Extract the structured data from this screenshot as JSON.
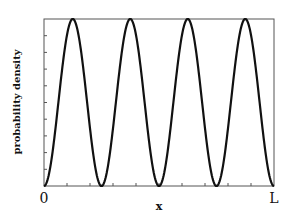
{
  "chart_data": {
    "type": "line",
    "title": "",
    "xlabel": "x",
    "ylabel": "probability density",
    "x_tick_labels": [
      "0",
      "L"
    ],
    "x_range": [
      0,
      1
    ],
    "y_range": [
      0,
      1
    ],
    "grid": false,
    "legend": null,
    "series": [
      {
        "name": "|psi_4(x)|^2",
        "function": "sin^2(4*pi*x/L)",
        "x": [
          0,
          0.0625,
          0.125,
          0.1875,
          0.25,
          0.3125,
          0.375,
          0.4375,
          0.5,
          0.5625,
          0.625,
          0.6875,
          0.75,
          0.8125,
          0.875,
          0.9375,
          1.0
        ],
        "values": [
          0,
          0.5,
          1,
          0.5,
          0,
          0.5,
          1,
          0.5,
          0,
          0.5,
          1,
          0.5,
          0,
          0.5,
          1,
          0.5,
          0
        ]
      }
    ],
    "peaks_at_fraction_of_L": [
      0.125,
      0.375,
      0.625,
      0.875
    ],
    "nodes_at_fraction_of_L": [
      0,
      0.25,
      0.5,
      0.75,
      1.0
    ],
    "y_minor_ticks": 10,
    "x_minor_ticks": 10
  },
  "labels": {
    "ylabel": "probability density",
    "xlabel": "x",
    "x_start": "0",
    "x_end": "L"
  },
  "style": {
    "line_color": "#111111",
    "axis_color": "#555555"
  }
}
